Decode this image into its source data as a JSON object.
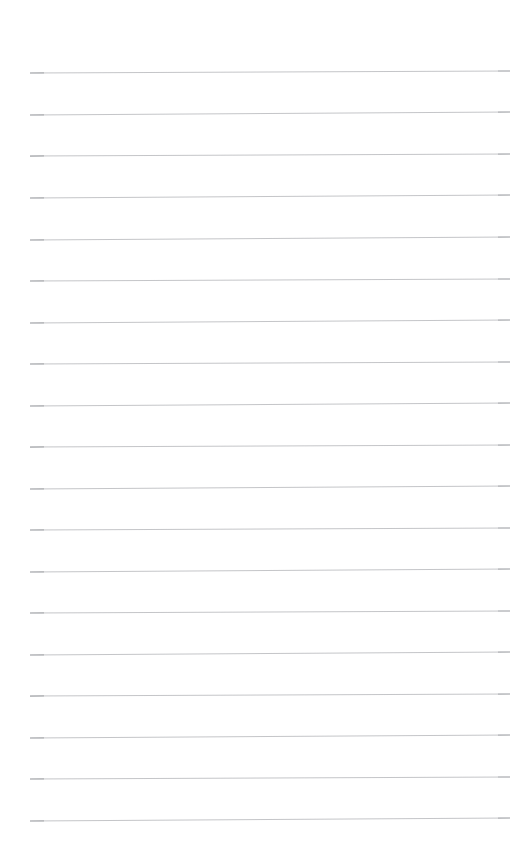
{
  "document": {
    "kind": "ruled-paper",
    "title": "Blank ruled page",
    "description": "A blank lined notebook page with evenly spaced horizontal rules and no written content.",
    "page_width": 516,
    "page_height": 852,
    "background_color": "#ffffff",
    "rule_color": "#b9bbbe",
    "rule_thickness": 1,
    "rule_count": 19,
    "rule_left_x": 30,
    "rule_right_x": 510,
    "rule_first_y": 73,
    "rule_spacing": 41.4,
    "top_margin": 73,
    "left_margin": 30,
    "right_margin": 6,
    "bottom_margin": 37,
    "written_text": "",
    "rules": [
      {
        "index": 1,
        "y_left": 73,
        "y_right": 71
      },
      {
        "index": 2,
        "y_left": 115,
        "y_right": 112
      },
      {
        "index": 3,
        "y_left": 156,
        "y_right": 154
      },
      {
        "index": 4,
        "y_left": 198,
        "y_right": 195
      },
      {
        "index": 5,
        "y_left": 240,
        "y_right": 237
      },
      {
        "index": 6,
        "y_left": 281,
        "y_right": 279
      },
      {
        "index": 7,
        "y_left": 323,
        "y_right": 320
      },
      {
        "index": 8,
        "y_left": 364,
        "y_right": 362
      },
      {
        "index": 9,
        "y_left": 406,
        "y_right": 403
      },
      {
        "index": 10,
        "y_left": 447,
        "y_right": 445
      },
      {
        "index": 11,
        "y_left": 489,
        "y_right": 486
      },
      {
        "index": 12,
        "y_left": 530,
        "y_right": 528
      },
      {
        "index": 13,
        "y_left": 572,
        "y_right": 569
      },
      {
        "index": 14,
        "y_left": 613,
        "y_right": 611
      },
      {
        "index": 15,
        "y_left": 655,
        "y_right": 652
      },
      {
        "index": 16,
        "y_left": 696,
        "y_right": 694
      },
      {
        "index": 17,
        "y_left": 738,
        "y_right": 735
      },
      {
        "index": 18,
        "y_left": 779,
        "y_right": 777
      },
      {
        "index": 19,
        "y_left": 821,
        "y_right": 818
      }
    ]
  }
}
